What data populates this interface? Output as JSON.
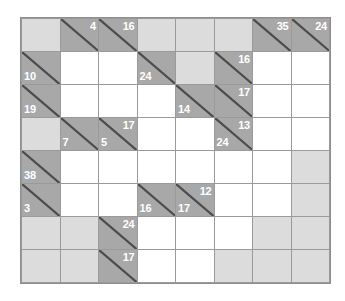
{
  "puzzle": {
    "type": "kakuro",
    "rows": 8,
    "cols": 8,
    "colors": {
      "open_cell": "#ffffff",
      "blocked_cell": "#dcdcdc",
      "clue_cell": "#a8a8a8",
      "grid_line": "#9a9a9a",
      "border": "#8e8e8e",
      "clue_text": "#ffffff",
      "diagonal": "#4c4c4c"
    },
    "grid": [
      [
        {
          "kind": "block",
          "down": "",
          "right": ""
        },
        {
          "kind": "clue",
          "down": "4",
          "right": ""
        },
        {
          "kind": "clue",
          "down": "16",
          "right": ""
        },
        {
          "kind": "block",
          "down": "",
          "right": ""
        },
        {
          "kind": "block",
          "down": "",
          "right": ""
        },
        {
          "kind": "block",
          "down": "",
          "right": ""
        },
        {
          "kind": "clue",
          "down": "35",
          "right": ""
        },
        {
          "kind": "clue",
          "down": "24",
          "right": ""
        }
      ],
      [
        {
          "kind": "clue",
          "down": "",
          "right": "10"
        },
        {
          "kind": "open",
          "down": "",
          "right": ""
        },
        {
          "kind": "open",
          "down": "",
          "right": ""
        },
        {
          "kind": "clue",
          "down": "",
          "right": "24"
        },
        {
          "kind": "block",
          "down": "",
          "right": ""
        },
        {
          "kind": "clue",
          "down": "16",
          "right": ""
        },
        {
          "kind": "open",
          "down": "",
          "right": ""
        },
        {
          "kind": "open",
          "down": "",
          "right": ""
        }
      ],
      [
        {
          "kind": "clue",
          "down": "",
          "right": "19"
        },
        {
          "kind": "open",
          "down": "",
          "right": ""
        },
        {
          "kind": "open",
          "down": "",
          "right": ""
        },
        {
          "kind": "open",
          "down": "",
          "right": ""
        },
        {
          "kind": "clue",
          "down": "",
          "right": "14"
        },
        {
          "kind": "clue",
          "down": "17",
          "right": ""
        },
        {
          "kind": "open",
          "down": "",
          "right": ""
        },
        {
          "kind": "open",
          "down": "",
          "right": ""
        }
      ],
      [
        {
          "kind": "block",
          "down": "",
          "right": ""
        },
        {
          "kind": "clue",
          "down": "",
          "right": "7"
        },
        {
          "kind": "clue",
          "down": "17",
          "right": "5"
        },
        {
          "kind": "open",
          "down": "",
          "right": ""
        },
        {
          "kind": "open",
          "down": "",
          "right": ""
        },
        {
          "kind": "clue",
          "down": "13",
          "right": "24"
        },
        {
          "kind": "open",
          "down": "",
          "right": ""
        },
        {
          "kind": "open",
          "down": "",
          "right": ""
        }
      ],
      [
        {
          "kind": "clue",
          "down": "",
          "right": "38"
        },
        {
          "kind": "open",
          "down": "",
          "right": ""
        },
        {
          "kind": "open",
          "down": "",
          "right": ""
        },
        {
          "kind": "open",
          "down": "",
          "right": ""
        },
        {
          "kind": "open",
          "down": "",
          "right": ""
        },
        {
          "kind": "open",
          "down": "",
          "right": ""
        },
        {
          "kind": "open",
          "down": "",
          "right": ""
        },
        {
          "kind": "block",
          "down": "",
          "right": ""
        }
      ],
      [
        {
          "kind": "clue",
          "down": "",
          "right": "3"
        },
        {
          "kind": "open",
          "down": "",
          "right": ""
        },
        {
          "kind": "open",
          "down": "",
          "right": ""
        },
        {
          "kind": "clue",
          "down": "",
          "right": "16"
        },
        {
          "kind": "clue",
          "down": "12",
          "right": "17"
        },
        {
          "kind": "open",
          "down": "",
          "right": ""
        },
        {
          "kind": "open",
          "down": "",
          "right": ""
        },
        {
          "kind": "block",
          "down": "",
          "right": ""
        }
      ],
      [
        {
          "kind": "block",
          "down": "",
          "right": ""
        },
        {
          "kind": "block",
          "down": "",
          "right": ""
        },
        {
          "kind": "clue",
          "down": "24",
          "right": ""
        },
        {
          "kind": "open",
          "down": "",
          "right": ""
        },
        {
          "kind": "open",
          "down": "",
          "right": ""
        },
        {
          "kind": "open",
          "down": "",
          "right": ""
        },
        {
          "kind": "block",
          "down": "",
          "right": ""
        },
        {
          "kind": "block",
          "down": "",
          "right": ""
        }
      ],
      [
        {
          "kind": "block",
          "down": "",
          "right": ""
        },
        {
          "kind": "block",
          "down": "",
          "right": ""
        },
        {
          "kind": "clue",
          "down": "17",
          "right": ""
        },
        {
          "kind": "open",
          "down": "",
          "right": ""
        },
        {
          "kind": "open",
          "down": "",
          "right": ""
        },
        {
          "kind": "block",
          "down": "",
          "right": ""
        },
        {
          "kind": "block",
          "down": "",
          "right": ""
        },
        {
          "kind": "block",
          "down": "",
          "right": ""
        }
      ]
    ]
  }
}
